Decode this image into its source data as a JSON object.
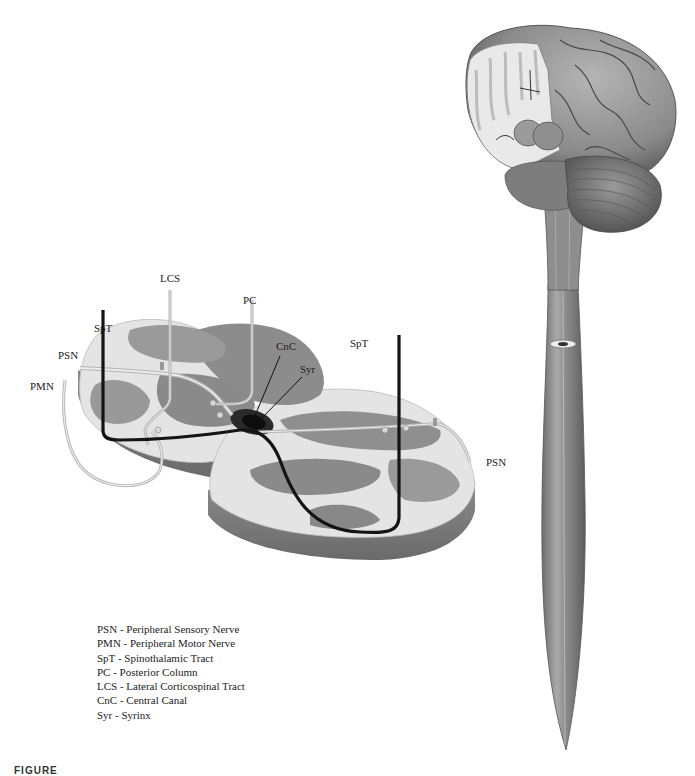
{
  "figure": {
    "caption_fragment": "FIGURE",
    "labels": {
      "lcs": "LCS",
      "pc": "PC",
      "spt_left": "SpT",
      "spt_right": "SpT",
      "psn_left": "PSN",
      "psn_right": "PSN",
      "pmn": "PMN",
      "cnc": "CnC",
      "syr": "Syr"
    },
    "legend": [
      {
        "abbr": "PSN",
        "text": "PSN - Peripheral Sensory Nerve"
      },
      {
        "abbr": "PMN",
        "text": "PMN - Peripheral Motor Nerve"
      },
      {
        "abbr": "SpT",
        "text": "SpT - Spinothalamic Tract"
      },
      {
        "abbr": "PC",
        "text": "PC - Posterior Column"
      },
      {
        "abbr": "LCS",
        "text": "LCS - Lateral Corticospinal Tract"
      },
      {
        "abbr": "CnC",
        "text": "CnC - Central Canal"
      },
      {
        "abbr": "Syr",
        "text": "Syr - Syrinx"
      }
    ],
    "colors": {
      "white_matter": "#e6e6e6",
      "gray_matter": "#8f8f8f",
      "side_wall": "#7a7a7a",
      "spt_tract": "#111111",
      "nerve": "#c9c9c9",
      "syrinx": "#1a1a1a",
      "brain": "#8a8a8a"
    }
  }
}
